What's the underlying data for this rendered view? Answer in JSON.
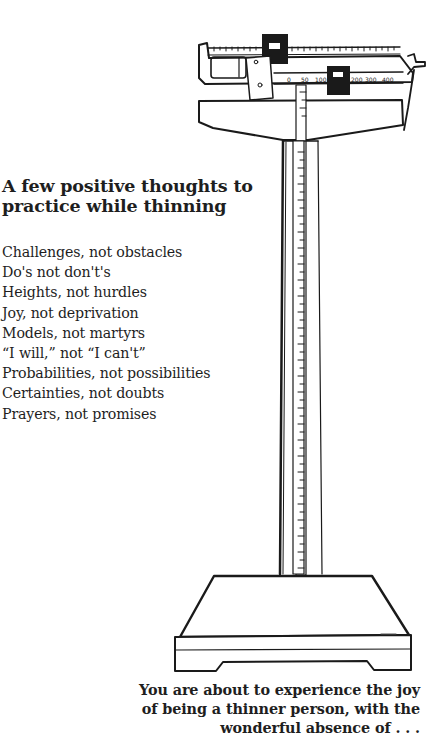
{
  "heading": {
    "line1": "A few positive thoughts to",
    "line2": "practice while thinning"
  },
  "thoughts": [
    "Challenges, not obstacles",
    "Do's not don't's",
    "Heights, not hurdles",
    "Joy, not deprivation",
    "Models, not martyrs",
    "“I will,” not “I can't”",
    "Probabilities, not possibilities",
    "Certainties, not doubts",
    "Prayers, not promises"
  ],
  "illustration": {
    "subject": "balance-beam-scale-icon",
    "beam_scale_labels": [
      "0",
      "50",
      "100",
      "150",
      "200",
      "300",
      "400"
    ],
    "ink_color": "#1a1a1a",
    "paper_color": "#ffffff"
  },
  "caption": {
    "line1": "You are about to experience the joy",
    "line2": "of being a thinner person, with the",
    "line3": "wonderful absence of . . ."
  }
}
